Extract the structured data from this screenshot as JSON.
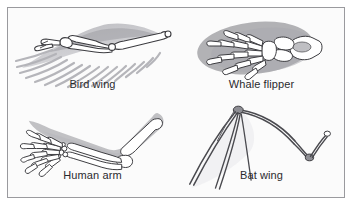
{
  "figure": {
    "panels": [
      {
        "id": "bird-wing",
        "label": "Bird wing",
        "position": "top-left"
      },
      {
        "id": "whale-flipper",
        "label": "Whale flipper",
        "position": "top-right"
      },
      {
        "id": "human-arm",
        "label": "Human arm",
        "position": "bottom-left"
      },
      {
        "id": "bat-wing",
        "label": "Bat wing",
        "position": "bottom-right"
      }
    ]
  },
  "colors": {
    "page_background": "#ffffff",
    "panel_background": "#fbfbfb",
    "frame_border": "#9a9a9e",
    "caption_text": "#2a2a2e",
    "bone_outline": "#3a3a3e",
    "bone_fill": "#ffffff",
    "soft_tissue_shadow": "#9d9da2",
    "feather_gray": "#b0b0b5"
  }
}
